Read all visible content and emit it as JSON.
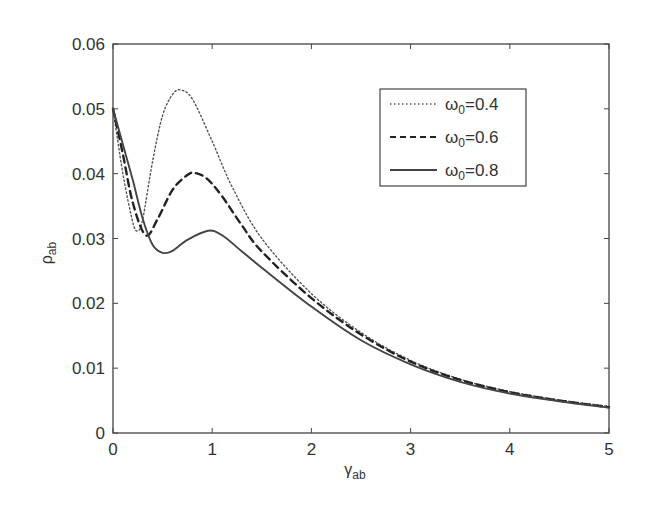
{
  "chart_data": {
    "type": "line",
    "title": "",
    "xlabel": "γ_ab",
    "ylabel": "ρ_ab",
    "xlim": [
      0,
      5
    ],
    "ylim": [
      0,
      0.06
    ],
    "xticks": [
      "0",
      "1",
      "2",
      "3",
      "4",
      "5"
    ],
    "yticks": [
      "0",
      "0.01",
      "0.02",
      "0.03",
      "0.04",
      "0.05",
      "0.06"
    ],
    "grid": false,
    "legend_position": "upper right",
    "series": [
      {
        "name": "ω0=0.4",
        "style": "dotted",
        "x": [
          0,
          0.1,
          0.2,
          0.25,
          0.3,
          0.4,
          0.5,
          0.6,
          0.68,
          0.8,
          1.0,
          1.2,
          1.5,
          2.0,
          2.5,
          3.0,
          3.5,
          4.0,
          4.5,
          5.0
        ],
        "y": [
          0.05,
          0.04,
          0.0325,
          0.0312,
          0.033,
          0.042,
          0.049,
          0.0522,
          0.0529,
          0.0515,
          0.045,
          0.038,
          0.03,
          0.0215,
          0.0155,
          0.0112,
          0.0083,
          0.0064,
          0.0051,
          0.0041
        ]
      },
      {
        "name": "ω0=0.6",
        "style": "dashed",
        "x": [
          0,
          0.1,
          0.2,
          0.33,
          0.45,
          0.6,
          0.75,
          0.83,
          0.95,
          1.1,
          1.3,
          1.5,
          2.0,
          2.5,
          3.0,
          3.5,
          4.0,
          4.5,
          5.0
        ],
        "y": [
          0.05,
          0.043,
          0.0355,
          0.0305,
          0.033,
          0.0375,
          0.0398,
          0.0401,
          0.0392,
          0.0365,
          0.032,
          0.028,
          0.0208,
          0.0152,
          0.011,
          0.0082,
          0.0063,
          0.005,
          0.004
        ]
      },
      {
        "name": "ω0=0.8",
        "style": "solid",
        "x": [
          0,
          0.1,
          0.2,
          0.3,
          0.4,
          0.5,
          0.6,
          0.75,
          0.96,
          1.1,
          1.3,
          1.5,
          2.0,
          2.5,
          3.0,
          3.5,
          4.0,
          4.5,
          5.0
        ],
        "y": [
          0.05,
          0.0445,
          0.039,
          0.033,
          0.029,
          0.0278,
          0.0281,
          0.0298,
          0.0312,
          0.0305,
          0.028,
          0.0255,
          0.0195,
          0.0143,
          0.0106,
          0.0079,
          0.0061,
          0.0049,
          0.0039
        ]
      }
    ]
  },
  "legend": {
    "items": [
      {
        "label": "ω",
        "sub": "0",
        "value": "=0.4"
      },
      {
        "label": "ω",
        "sub": "0",
        "value": "=0.6"
      },
      {
        "label": "ω",
        "sub": "0",
        "value": "=0.8"
      }
    ]
  },
  "axes": {
    "xlabel_main": "γ",
    "xlabel_sub": "ab",
    "ylabel_main": "ρ",
    "ylabel_sub": "ab"
  },
  "colors": {
    "axis": "#444444",
    "line": "#333333",
    "background": "#ffffff"
  }
}
